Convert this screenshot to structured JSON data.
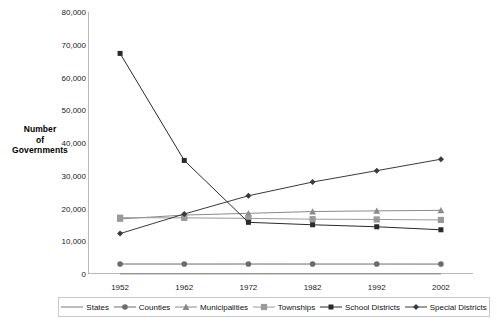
{
  "chart_data": {
    "type": "line",
    "title": "",
    "xlabel": "",
    "ylabel": "Number of Governments",
    "ylabel_lines": [
      "Number",
      "of",
      "Governments"
    ],
    "x": [
      1952,
      1962,
      1972,
      1982,
      1992,
      2002
    ],
    "categories": [
      "1952",
      "1962",
      "1972",
      "1982",
      "1992",
      "2002"
    ],
    "ylim": [
      0,
      80000
    ],
    "ytick_labels": [
      "0",
      "10,000",
      "20,000",
      "30,000",
      "40,000",
      "50,000",
      "60,000",
      "70,000",
      "80,000"
    ],
    "ytick_values": [
      0,
      10000,
      20000,
      30000,
      40000,
      50000,
      60000,
      70000,
      80000
    ],
    "grid": false,
    "legend_position": "bottom",
    "series": [
      {
        "name": "States",
        "marker": "none",
        "color": "#7d7d7d",
        "values": [
          50,
          50,
          50,
          50,
          50,
          50
        ]
      },
      {
        "name": "Counties",
        "marker": "circle",
        "color": "#6b6b6b",
        "values": [
          3052,
          3043,
          3044,
          3041,
          3043,
          3034
        ]
      },
      {
        "name": "Municipalities",
        "marker": "triangle",
        "color": "#8a8a8a",
        "values": [
          16807,
          18000,
          18517,
          19076,
          19279,
          19429
        ]
      },
      {
        "name": "Townships",
        "marker": "square",
        "color": "#9a9a9a",
        "values": [
          17202,
          17142,
          16991,
          16734,
          16656,
          16504
        ]
      },
      {
        "name": "School Districts",
        "marker": "bsquare",
        "color": "#2a2a2a",
        "values": [
          67355,
          34678,
          15781,
          15032,
          14422,
          13506
        ]
      },
      {
        "name": "Special Districts",
        "marker": "diamond",
        "color": "#3a3a3a",
        "values": [
          12340,
          18323,
          23885,
          28078,
          31555,
          35052
        ]
      }
    ],
    "annotations": []
  },
  "legend": {
    "items": [
      {
        "label": "States"
      },
      {
        "label": "Counties"
      },
      {
        "label": "Municipalities"
      },
      {
        "label": "Townships"
      },
      {
        "label": "School Districts"
      },
      {
        "label": "Special Districts"
      }
    ]
  }
}
